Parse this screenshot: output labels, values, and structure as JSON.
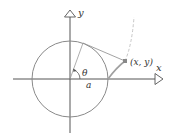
{
  "diagram": {
    "type": "involute-of-circle",
    "labels": {
      "x_axis": "x",
      "y_axis": "y",
      "point": "(x, y)",
      "angle": "θ",
      "radius": "a"
    },
    "colors": {
      "axes": "#555555",
      "circle": "#8a8a8a",
      "curve": "#a0a0a0",
      "point": "#888888",
      "text": "#333333"
    }
  }
}
